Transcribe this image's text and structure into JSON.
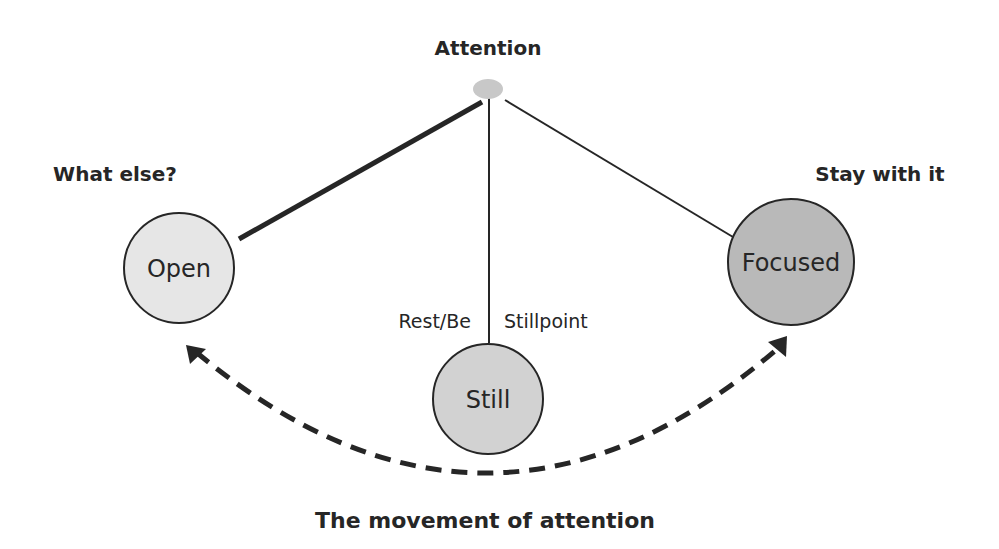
{
  "diagram": {
    "title": "The movement of attention",
    "apex": {
      "label": "Attention",
      "fill": "#c8c8c8"
    },
    "nodes": {
      "open": {
        "label": "Open",
        "caption": "What else?",
        "fill": "#e6e6e6"
      },
      "still": {
        "label": "Still",
        "fill": "#d2d2d2",
        "side_left": "Rest/Be",
        "side_right": "Stillpoint"
      },
      "focused": {
        "label": "Focused",
        "caption": "Stay with it",
        "fill": "#b9b9b9"
      }
    },
    "edges": [
      {
        "from": "Attention",
        "to": "Open",
        "style": "thick"
      },
      {
        "from": "Attention",
        "to": "Still",
        "style": "thin"
      },
      {
        "from": "Attention",
        "to": "Focused",
        "style": "thin"
      }
    ],
    "movement_arrow": {
      "from": "Focused",
      "to": "Open",
      "style": "dashed",
      "direction": "bidirectional"
    },
    "colors": {
      "stroke": "#262626",
      "text": "#262626",
      "background": "#ffffff"
    }
  }
}
